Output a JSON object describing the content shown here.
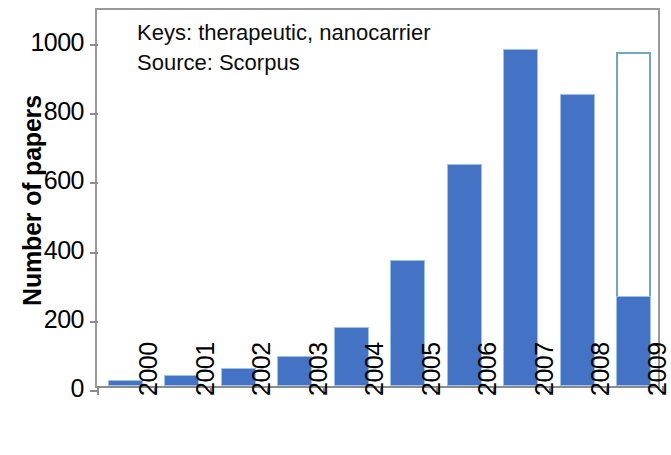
{
  "chart_data": {
    "type": "bar",
    "title": "",
    "subtitle": "",
    "xlabel": "",
    "ylabel": "Number of papers",
    "categories": [
      "2000",
      "2001",
      "2002",
      "2003",
      "2004",
      "2005",
      "2006",
      "2007",
      "2008",
      "2009"
    ],
    "values": [
      16,
      32,
      52,
      88,
      170,
      364,
      642,
      974,
      844,
      260
    ],
    "series": [
      {
        "name": "Number of papers",
        "values": [
          16,
          32,
          52,
          88,
          170,
          364,
          642,
          974,
          844,
          260
        ]
      },
      {
        "name": "Projected (2009 outline)",
        "values": [
          null,
          null,
          null,
          null,
          null,
          null,
          null,
          null,
          null,
          965
        ]
      }
    ],
    "ylim": [
      0,
      1050
    ],
    "yticks": [
      0,
      200,
      400,
      600,
      800,
      1000
    ],
    "yticklabels": [
      "0",
      "200",
      "400",
      "600",
      "800",
      "1000"
    ],
    "grid": false,
    "legend": "none",
    "bar_color": "#4472C4",
    "projection_outline_color": "#6fa8bf",
    "axis_color": "#8c8c8c",
    "annotations": [
      "Keys: therapeutic, nanocarrier",
      "Source: Scorpus"
    ]
  },
  "annotation": {
    "line1": "Keys: therapeutic, nanocarrier",
    "line2": "Source: Scorpus"
  },
  "axes": {
    "y_title": "Number of papers"
  }
}
